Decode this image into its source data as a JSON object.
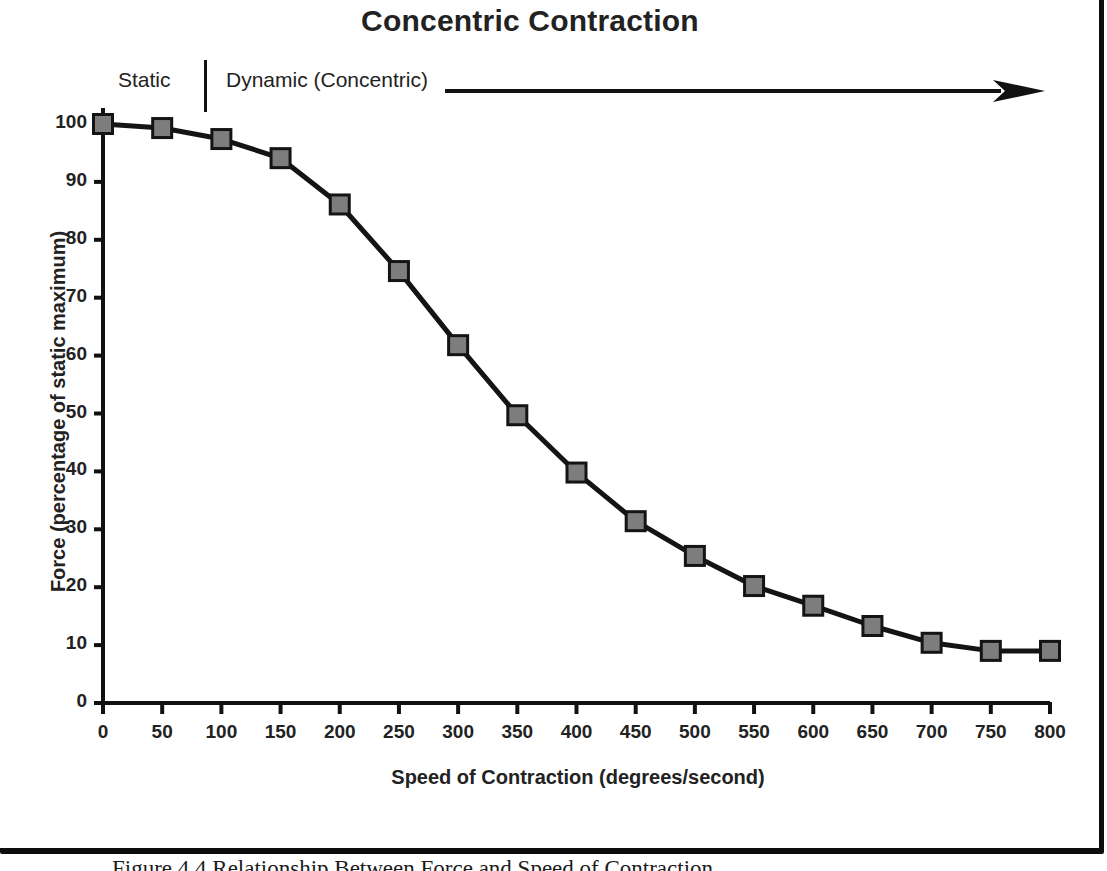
{
  "figure": {
    "caption": "Figure 4.4  Relationship Between Force and Speed of Contraction",
    "frame_color": "#0d0d0d"
  },
  "annotations": {
    "static_label": "Static",
    "dynamic_label": "Dynamic (Concentric)",
    "arrow_icon": "right-arrow-icon",
    "divider_icon": "vertical-divider-icon"
  },
  "chart_data": {
    "type": "line",
    "title": "Concentric Contraction",
    "xlabel": "Speed of Contraction (degrees/second)",
    "ylabel": "Force (percentage of static maximum)",
    "xlim": [
      0,
      800
    ],
    "ylim": [
      0,
      100
    ],
    "xticks": [
      0,
      50,
      100,
      150,
      200,
      250,
      300,
      350,
      400,
      450,
      500,
      550,
      600,
      650,
      700,
      750,
      800
    ],
    "yticks": [
      0,
      10,
      20,
      30,
      40,
      50,
      60,
      70,
      80,
      90,
      100
    ],
    "grid": false,
    "legend": null,
    "marker": "square",
    "marker_fill": "#7d7d7d",
    "marker_edge": "#141414",
    "line_color": "#141414",
    "line_width": 5,
    "x": [
      0,
      50,
      100,
      150,
      200,
      250,
      300,
      350,
      400,
      450,
      500,
      550,
      600,
      650,
      700,
      750,
      800
    ],
    "values": [
      100,
      99.3,
      97.4,
      94.1,
      86.1,
      74.6,
      61.8,
      49.7,
      39.8,
      31.4,
      25.4,
      20.2,
      16.8,
      13.3,
      10.4,
      9.0,
      9.0
    ],
    "series": [
      {
        "name": "Concentric Contraction",
        "values": [
          100,
          99.3,
          97.4,
          94.1,
          86.1,
          74.6,
          61.8,
          49.7,
          39.8,
          31.4,
          25.4,
          20.2,
          16.8,
          13.3,
          10.4,
          9.0,
          9.0
        ]
      }
    ]
  }
}
